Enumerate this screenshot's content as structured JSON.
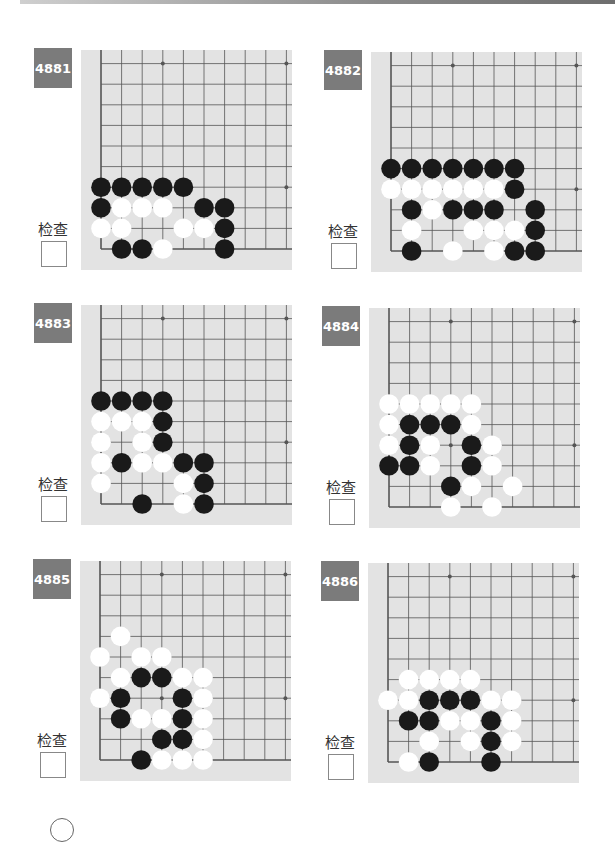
{
  "page": {
    "check_label": "检查"
  },
  "grid": {
    "cols": 10,
    "rows": 10,
    "spacing": 20.6,
    "origin_x": 20,
    "origin_y": 199,
    "star_points": [
      [
        3,
        9
      ],
      [
        9,
        9
      ],
      [
        3,
        3
      ],
      [
        9,
        3
      ]
    ]
  },
  "colors": {
    "board_bg": "#e3e3e3",
    "line": "#555555",
    "black": "#1a1a1a",
    "white": "#ffffff",
    "label_bg": "#7b7b7b"
  },
  "problems": [
    {
      "id": "4881",
      "black": [
        [
          0,
          3
        ],
        [
          1,
          3
        ],
        [
          2,
          3
        ],
        [
          3,
          3
        ],
        [
          4,
          3
        ],
        [
          0,
          2
        ],
        [
          5,
          2
        ],
        [
          6,
          2
        ],
        [
          6,
          1
        ],
        [
          1,
          0
        ],
        [
          2,
          0
        ],
        [
          6,
          0
        ]
      ],
      "white": [
        [
          1,
          2
        ],
        [
          2,
          2
        ],
        [
          3,
          2
        ],
        [
          0,
          1
        ],
        [
          1,
          1
        ],
        [
          4,
          1
        ],
        [
          5,
          1
        ],
        [
          3,
          0
        ]
      ]
    },
    {
      "id": "4882",
      "black": [
        [
          0,
          4
        ],
        [
          1,
          4
        ],
        [
          2,
          4
        ],
        [
          3,
          4
        ],
        [
          4,
          4
        ],
        [
          5,
          4
        ],
        [
          6,
          4
        ],
        [
          6,
          3
        ],
        [
          1,
          2
        ],
        [
          3,
          2
        ],
        [
          4,
          2
        ],
        [
          5,
          2
        ],
        [
          7,
          2
        ],
        [
          7,
          1
        ],
        [
          1,
          0
        ],
        [
          6,
          0
        ],
        [
          7,
          0
        ]
      ],
      "white": [
        [
          0,
          3
        ],
        [
          1,
          3
        ],
        [
          2,
          3
        ],
        [
          3,
          3
        ],
        [
          4,
          3
        ],
        [
          5,
          3
        ],
        [
          2,
          2
        ],
        [
          1,
          1
        ],
        [
          4,
          1
        ],
        [
          5,
          1
        ],
        [
          6,
          1
        ],
        [
          3,
          0
        ],
        [
          5,
          0
        ]
      ]
    },
    {
      "id": "4883",
      "black": [
        [
          0,
          5
        ],
        [
          1,
          5
        ],
        [
          2,
          5
        ],
        [
          3,
          5
        ],
        [
          3,
          4
        ],
        [
          3,
          3
        ],
        [
          1,
          2
        ],
        [
          4,
          2
        ],
        [
          5,
          2
        ],
        [
          5,
          1
        ],
        [
          2,
          0
        ],
        [
          5,
          0
        ]
      ],
      "white": [
        [
          0,
          4
        ],
        [
          1,
          4
        ],
        [
          2,
          4
        ],
        [
          0,
          3
        ],
        [
          2,
          3
        ],
        [
          0,
          2
        ],
        [
          2,
          2
        ],
        [
          3,
          2
        ],
        [
          0,
          1
        ],
        [
          4,
          1
        ],
        [
          4,
          0
        ]
      ]
    },
    {
      "id": "4884",
      "black": [
        [
          1,
          4
        ],
        [
          2,
          4
        ],
        [
          3,
          4
        ],
        [
          1,
          3
        ],
        [
          4,
          3
        ],
        [
          0,
          2
        ],
        [
          1,
          2
        ],
        [
          4,
          2
        ],
        [
          3,
          1
        ]
      ],
      "white": [
        [
          0,
          5
        ],
        [
          1,
          5
        ],
        [
          2,
          5
        ],
        [
          3,
          5
        ],
        [
          4,
          5
        ],
        [
          0,
          4
        ],
        [
          4,
          4
        ],
        [
          0,
          3
        ],
        [
          2,
          3
        ],
        [
          5,
          3
        ],
        [
          2,
          2
        ],
        [
          5,
          2
        ],
        [
          4,
          1
        ],
        [
          6,
          1
        ],
        [
          3,
          0
        ],
        [
          5,
          0
        ]
      ]
    },
    {
      "id": "4885",
      "black": [
        [
          2,
          4
        ],
        [
          3,
          4
        ],
        [
          1,
          3
        ],
        [
          4,
          3
        ],
        [
          1,
          2
        ],
        [
          4,
          2
        ],
        [
          3,
          1
        ],
        [
          4,
          1
        ],
        [
          2,
          0
        ]
      ],
      "white": [
        [
          1,
          6
        ],
        [
          0,
          5
        ],
        [
          2,
          5
        ],
        [
          3,
          5
        ],
        [
          1,
          4
        ],
        [
          4,
          4
        ],
        [
          5,
          4
        ],
        [
          0,
          3
        ],
        [
          5,
          3
        ],
        [
          2,
          2
        ],
        [
          3,
          2
        ],
        [
          5,
          2
        ],
        [
          5,
          1
        ],
        [
          3,
          0
        ],
        [
          4,
          0
        ],
        [
          5,
          0
        ]
      ]
    },
    {
      "id": "4886",
      "black": [
        [
          2,
          3
        ],
        [
          3,
          3
        ],
        [
          4,
          3
        ],
        [
          1,
          2
        ],
        [
          2,
          2
        ],
        [
          5,
          2
        ],
        [
          5,
          1
        ],
        [
          2,
          0
        ],
        [
          5,
          0
        ]
      ],
      "white": [
        [
          1,
          4
        ],
        [
          2,
          4
        ],
        [
          3,
          4
        ],
        [
          4,
          4
        ],
        [
          0,
          3
        ],
        [
          1,
          3
        ],
        [
          5,
          3
        ],
        [
          6,
          3
        ],
        [
          3,
          2
        ],
        [
          4,
          2
        ],
        [
          6,
          2
        ],
        [
          2,
          1
        ],
        [
          4,
          1
        ],
        [
          6,
          1
        ],
        [
          1,
          0
        ]
      ]
    }
  ]
}
